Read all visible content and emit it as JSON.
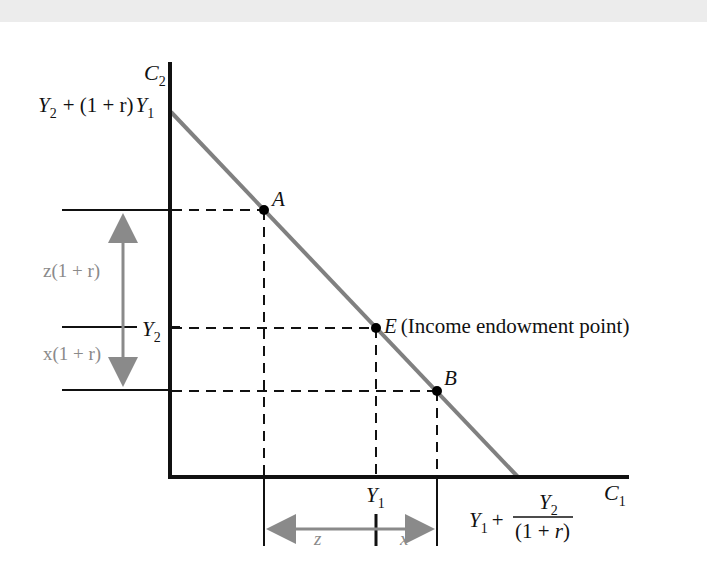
{
  "diagram": {
    "type": "intertemporal-budget-constraint",
    "axes": {
      "y_label": "C",
      "y_label_sub": "2",
      "x_label": "C",
      "x_label_sub": "1"
    },
    "y_intercept": {
      "y": "Y",
      "y_sub": "2",
      "plus": "+ (1 + r)",
      "y1": "Y",
      "y1_sub": "1"
    },
    "x_intercept": {
      "y1": "Y",
      "y1_sub": "1",
      "plus": "+",
      "num": "Y",
      "num_sub": "2",
      "den": "(1 + ",
      "den_r": "r",
      "den_close": ")"
    },
    "ticks": {
      "y2": "Y",
      "y2_sub": "2",
      "y1": "Y",
      "y1_sub": "1"
    },
    "points": [
      {
        "name": "A",
        "label": "A"
      },
      {
        "name": "E",
        "label": "E",
        "note": "(Income endowment point)"
      },
      {
        "name": "B",
        "label": "B"
      }
    ],
    "brackets": {
      "z_vertical": "z(1 + r)",
      "x_vertical": "x(1 + r)",
      "z_horizontal": "z",
      "x_horizontal": "x"
    },
    "colors": {
      "axis": "#111111",
      "budget_line": "#808080",
      "arrows": "#8a8a8a",
      "points": "#000000"
    }
  }
}
